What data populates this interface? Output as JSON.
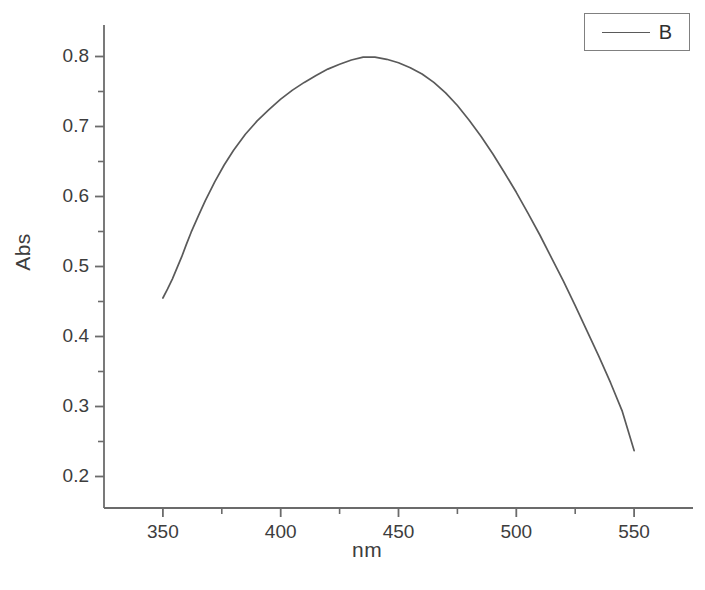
{
  "chart_data": {
    "type": "line",
    "title": "",
    "xlabel": "nm",
    "ylabel": "Abs",
    "xlim": [
      325,
      575
    ],
    "ylim": [
      0.155,
      0.845
    ],
    "grid": false,
    "legend_position": "top-right",
    "x_ticks_major": [
      350,
      400,
      450,
      500,
      550
    ],
    "x_tick_labels": [
      "350",
      "400",
      "450",
      "500",
      "550"
    ],
    "x_ticks_minor": [
      375,
      425,
      475,
      525
    ],
    "y_ticks_major": [
      0.2,
      0.3,
      0.4,
      0.5,
      0.6,
      0.7,
      0.8
    ],
    "y_tick_labels": [
      "0.2",
      "0.3",
      "0.4",
      "0.5",
      "0.6",
      "0.7",
      "0.8"
    ],
    "y_ticks_minor": [
      0.25,
      0.35,
      0.45,
      0.55,
      0.65,
      0.75
    ],
    "series": [
      {
        "name": "B",
        "color": "#5a5a5a",
        "x": [
          350,
          352,
          354,
          356,
          358,
          360,
          362,
          365,
          368,
          372,
          376,
          380,
          385,
          390,
          395,
          400,
          405,
          410,
          415,
          420,
          425,
          430,
          435,
          440,
          445,
          450,
          455,
          460,
          465,
          470,
          475,
          480,
          485,
          490,
          495,
          500,
          505,
          510,
          515,
          520,
          525,
          530,
          535,
          540,
          545,
          550
        ],
        "y": [
          0.455,
          0.468,
          0.482,
          0.498,
          0.514,
          0.532,
          0.549,
          0.572,
          0.594,
          0.621,
          0.645,
          0.666,
          0.689,
          0.708,
          0.724,
          0.739,
          0.752,
          0.763,
          0.773,
          0.782,
          0.789,
          0.795,
          0.799,
          0.799,
          0.796,
          0.791,
          0.784,
          0.775,
          0.763,
          0.748,
          0.73,
          0.709,
          0.686,
          0.661,
          0.634,
          0.606,
          0.576,
          0.545,
          0.512,
          0.479,
          0.444,
          0.408,
          0.372,
          0.334,
          0.293,
          0.237
        ]
      }
    ],
    "peak": {
      "x": 437,
      "y": 0.8
    },
    "legend_entries": [
      "B"
    ]
  },
  "axes": {
    "y_title": "Abs",
    "x_title": "nm"
  },
  "legend": {
    "label": "B"
  },
  "style": {
    "line_color": "#5a5a5a",
    "axis_color": "#6b6b6b",
    "text_color": "#3d3d3d",
    "background": "#ffffff"
  }
}
